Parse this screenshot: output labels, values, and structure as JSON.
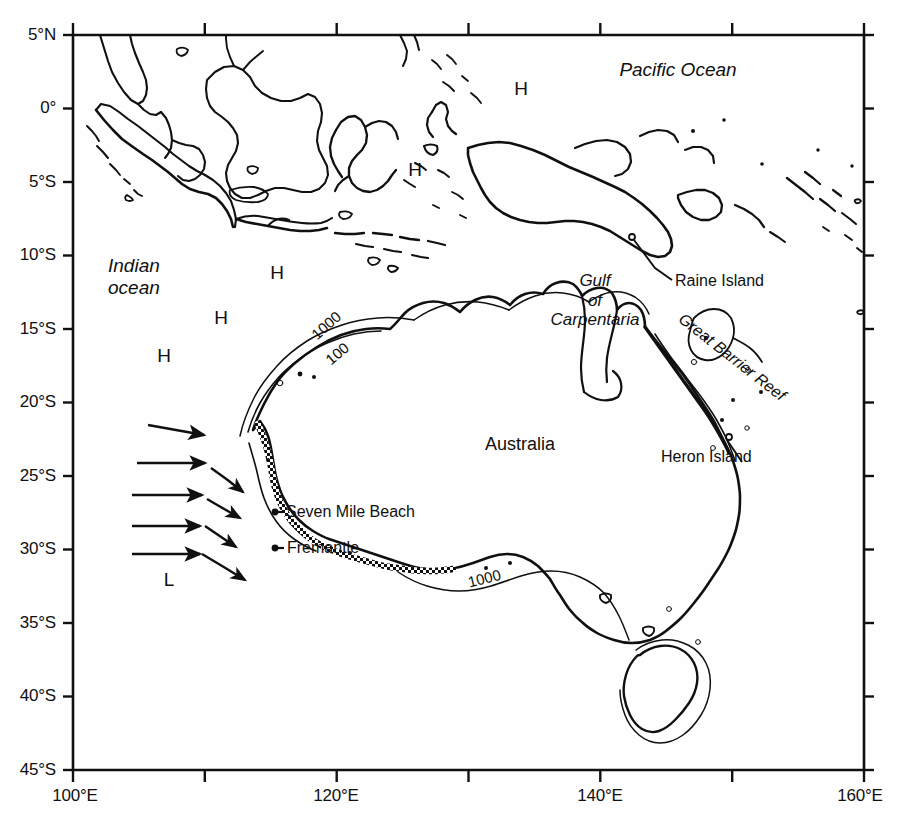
{
  "figure": {
    "type": "map",
    "title": "",
    "projection": "equirectangular",
    "background_color": "#fefefe",
    "line_color": "#101010",
    "region": "Australia and the Maritime Continent"
  },
  "axes": {
    "x_range": [
      100,
      160
    ],
    "y_range": [
      -45,
      5
    ],
    "x_unit": "degrees east",
    "y_unit": "degrees latitude",
    "frame": {
      "left": 73,
      "right": 864,
      "top": 35,
      "bottom": 770
    },
    "x_ticks": [
      {
        "value": 100,
        "label": "100°E",
        "major": true
      },
      {
        "value": 110,
        "label": "",
        "major": false
      },
      {
        "value": 120,
        "label": "120°E",
        "major": true
      },
      {
        "value": 130,
        "label": "",
        "major": false
      },
      {
        "value": 140,
        "label": "140°E",
        "major": true
      },
      {
        "value": 150,
        "label": "",
        "major": false
      },
      {
        "value": 160,
        "label": "160°E",
        "major": true
      }
    ],
    "y_ticks": [
      {
        "value": 5,
        "label": "5°N"
      },
      {
        "value": 0,
        "label": "0°"
      },
      {
        "value": -5,
        "label": "5°S"
      },
      {
        "value": -10,
        "label": "10°S"
      },
      {
        "value": -15,
        "label": "15°S"
      },
      {
        "value": -20,
        "label": "20°S"
      },
      {
        "value": -25,
        "label": "25°S"
      },
      {
        "value": -30,
        "label": "30°S"
      },
      {
        "value": -35,
        "label": "35°S"
      },
      {
        "value": -40,
        "label": "40°S"
      },
      {
        "value": -45,
        "label": "45°S"
      }
    ]
  },
  "labels": {
    "oceans": [
      {
        "name": "pacific-ocean",
        "text": "Pacific Ocean",
        "lon": 148.5,
        "lat": 2.6,
        "style": "italic"
      },
      {
        "name": "indian-ocean",
        "text": "Indian\nocean",
        "lon": 110.8,
        "lat": -12.5,
        "style": "italic"
      }
    ],
    "regions": [
      {
        "name": "australia",
        "text": "Australia",
        "lon": 137.0,
        "lat": -25.3,
        "style": "upright"
      },
      {
        "name": "gulf-of-carpentaria",
        "text": "Gulf\nof\nCarpentaria",
        "lon": 139.8,
        "lat": -13.6,
        "style": "italic"
      },
      {
        "name": "great-barrier-reef",
        "text": "Great Barrier Reef",
        "lon": 146.4,
        "lat": -17.8,
        "style": "italic",
        "rotation": 38
      }
    ],
    "places": [
      {
        "name": "raine-island",
        "text": "Raine Island",
        "lon": 147.2,
        "lat": -13.9,
        "marker_lon": 144.3,
        "marker_lat": -12.4
      },
      {
        "name": "heron-island",
        "text": "Heron Island",
        "lon": 146.0,
        "lat": -26.4,
        "marker_lon": 151.9,
        "marker_lat": -23.9
      },
      {
        "name": "seven-mile-beach",
        "text": "Seven Mile Beach",
        "lon": 121.0,
        "lat": -30.0,
        "marker_lon": 115.1,
        "marker_lat": -30.0
      },
      {
        "name": "fremantle",
        "text": "Fremantle",
        "lon": 121.3,
        "lat": -32.5,
        "marker_lon": 115.6,
        "marker_lat": -32.4
      }
    ],
    "pressure_markers": [
      {
        "name": "high-1",
        "text": "H",
        "lon": 139.5,
        "lat": 1.8
      },
      {
        "name": "high-2",
        "text": "H",
        "lon": 131.4,
        "lat": -4.6
      },
      {
        "name": "high-3",
        "text": "H",
        "lon": 115.5,
        "lat": -12.7
      },
      {
        "name": "high-4",
        "text": "H",
        "lon": 112.5,
        "lat": -15.8
      },
      {
        "name": "high-5",
        "text": "H",
        "lon": 108.8,
        "lat": -19.7
      },
      {
        "name": "low-1",
        "text": "L",
        "lon": 109.2,
        "lat": -34.8
      }
    ],
    "contours": [
      {
        "name": "contour-1000-west",
        "text": "1000",
        "lon": 113.6,
        "lat": -16.7,
        "rotation": -42,
        "depth_m": 1000
      },
      {
        "name": "contour-100-west",
        "text": "100",
        "lon": 114.9,
        "lat": -18.8,
        "rotation": -40,
        "depth_m": 100
      },
      {
        "name": "contour-1000-south",
        "text": "1000",
        "lon": 135.9,
        "lat": -35.3,
        "rotation": -14,
        "depth_m": 1000
      }
    ]
  },
  "flow_arrows": {
    "straight": [
      {
        "name": "wind-arrow-1",
        "x1": 108.9,
        "y1": -24.5,
        "x2": 113.4,
        "y2": -25.3
      },
      {
        "name": "wind-arrow-2",
        "x1": 108.0,
        "y1": -27.1,
        "x2": 113.4,
        "y2": -27.1
      },
      {
        "name": "wind-arrow-3",
        "x1": 107.6,
        "y1": -29.3,
        "x2": 113.2,
        "y2": -29.3
      },
      {
        "name": "wind-arrow-4",
        "x1": 107.6,
        "y1": -31.4,
        "x2": 113.0,
        "y2": -31.4
      },
      {
        "name": "wind-arrow-5",
        "x1": 107.6,
        "y1": -33.3,
        "x2": 113.0,
        "y2": -33.3
      }
    ],
    "curved": [
      {
        "name": "current-arrow-1",
        "x1": 113.9,
        "y1": -27.4,
        "x2": 117.2,
        "y2": -29.2
      },
      {
        "name": "current-arrow-2",
        "x1": 113.6,
        "y1": -29.5,
        "x2": 117.0,
        "y2": -31.0
      },
      {
        "name": "current-arrow-3",
        "x1": 113.4,
        "y1": -31.3,
        "x2": 116.7,
        "y2": -32.6
      },
      {
        "name": "current-arrow-4",
        "x1": 113.2,
        "y1": -33.2,
        "x2": 117.1,
        "y2": -35.2
      }
    ]
  },
  "coast_features": {
    "beaded_coast_note": "dotted/beaded shoreline along Western and Southern Australian coast",
    "depth_contours_shown": [
      100,
      1000
    ]
  }
}
